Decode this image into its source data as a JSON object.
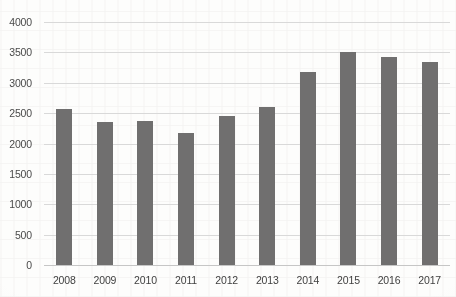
{
  "chart_data": {
    "type": "bar",
    "title": "",
    "subtitle": "",
    "xlabel": "",
    "ylabel": "",
    "categories": [
      "2008",
      "2009",
      "2010",
      "2011",
      "2012",
      "2013",
      "2014",
      "2015",
      "2016",
      "2017"
    ],
    "values": [
      2570,
      2355,
      2375,
      2175,
      2450,
      2600,
      3170,
      3510,
      3420,
      3345
    ],
    "series": [
      {
        "name": "",
        "values": [
          2570,
          2355,
          2375,
          2175,
          2450,
          2600,
          3170,
          3510,
          3420,
          3345
        ]
      }
    ],
    "ylim": [
      0,
      4000
    ],
    "ytick_labels": [
      "0",
      "500",
      "1000",
      "1500",
      "2000",
      "2500",
      "3000",
      "3500",
      "4000"
    ],
    "ytick_values": [
      0,
      500,
      1000,
      1500,
      2000,
      2500,
      3000,
      3500,
      4000
    ],
    "grid": true,
    "grid_axis": "y",
    "legend": false,
    "legend_position": "none",
    "bar_color": "#706F6F",
    "gridline_color": "#D9D9D9",
    "axis_label_color": "#4A4A4A",
    "background_color": "#FDFDFC",
    "annotations": []
  }
}
